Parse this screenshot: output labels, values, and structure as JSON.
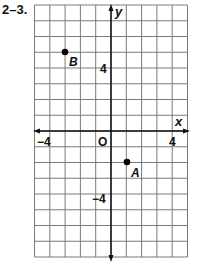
{
  "problem_label": "2–3.",
  "chart_data": {
    "type": "scatter",
    "title": "",
    "xlabel": "x",
    "ylabel": "y",
    "xlim": [
      -5,
      5
    ],
    "ylim": [
      -8,
      8
    ],
    "grid": true,
    "origin_label": "O",
    "x_tick_labels": [
      {
        "value": -4,
        "label": "−4"
      },
      {
        "value": 4,
        "label": "4"
      }
    ],
    "y_tick_labels": [
      {
        "value": 4,
        "label": "4"
      },
      {
        "value": -4,
        "label": "−4"
      }
    ],
    "points": [
      {
        "name": "B",
        "x": -3,
        "y": 5
      },
      {
        "name": "A",
        "x": 1,
        "y": -2
      }
    ]
  },
  "colors": {
    "grid": "#7a7a7a",
    "axis": "#111111",
    "point": "#000000"
  }
}
